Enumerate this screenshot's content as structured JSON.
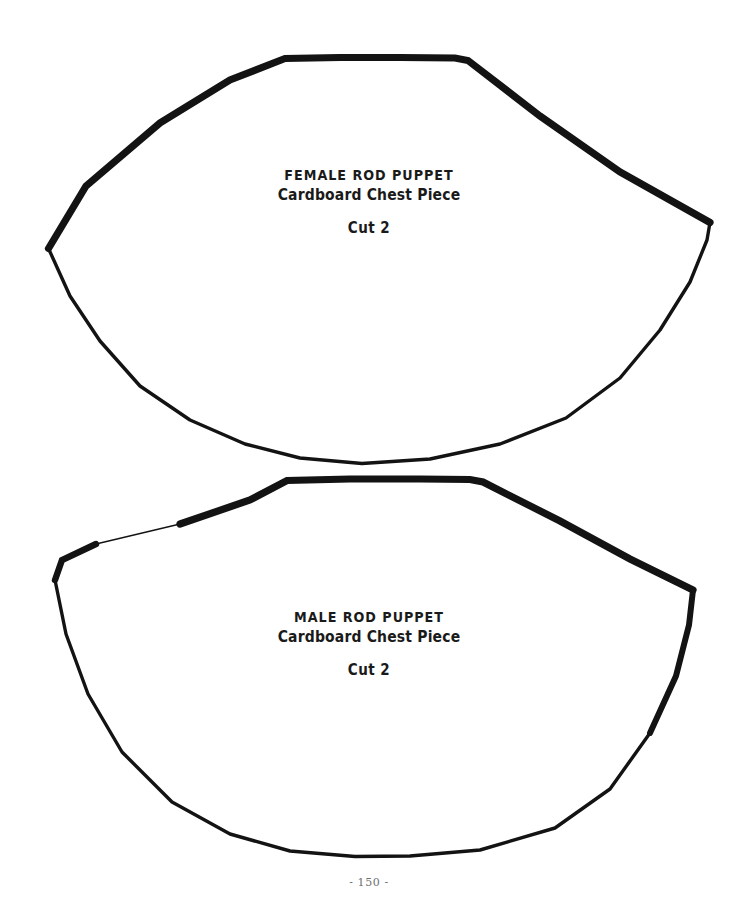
{
  "page": {
    "background_color": "#ffffff",
    "ink_color": "#131313",
    "page_number": "- 150 -",
    "page_number_color": "#6f6f6f"
  },
  "patterns": [
    {
      "id": "female-chest-piece",
      "title": "FEMALE ROD PUPPET",
      "subtitle": "Cardboard Chest Piece",
      "cut_instruction": "Cut 2",
      "shape_name": "fan-shaped-chest-piece",
      "outline_path": "M 48.5 248.5 L 86 186 L 160 123 L 230 80 L 285 58.5 L 340 57.5 L 400 57.5 L 455 58 L 468 60.5 L 540 116 L 620 172 L 710 222.5 L 707 240 L 690 282 L 660 330 L 620 378 L 566 418 L 500 444 L 430 459 L 362 463.5 L 300 458 L 245 444 L 190 420 L 140 386 L 100 341 L 70 296 Z",
      "heavy_segments": [
        "M 48.5 248.5 L 86 186 L 160 123 L 230 80 L 285 58.5 L 340 57.5 L 400 57.5 L 455 58 L 468 60.5 L 540 116 L 620 172 L 710 222.5"
      ],
      "thin_segments": [
        "M 710 222.5 L 707 240 L 690 282 L 660 330 L 620 378 L 566 418 L 500 444 L 430 459 L 362 463.5 L 300 458 L 245 444 L 190 420 L 140 386 L 100 341 L 70 296 L 48.5 248.5"
      ]
    },
    {
      "id": "male-chest-piece",
      "title": "MALE ROD PUPPET",
      "subtitle": "Cardboard Chest Piece",
      "cut_instruction": "Cut 2",
      "shape_name": "fan-shaped-chest-piece",
      "outline_path": "M 55 580 L 62 560 L 96 544 L 180 524 L 250 500 L 287 480.5 L 350 479 L 420 479 L 470 479.5 L 483 482 L 560 521 L 630 559 L 693 590 L 689 625 L 676 676 L 650 733 L 610 789 L 555 828 L 480 850 L 410 856 L 355 856.5 L 290 851 L 230 834 L 172 802 L 122 752 L 88 694 L 66 634 Z",
      "heavy_segments": [
        "M 55 580 L 62 560 L 96 544",
        "M 180 524 L 250 500 L 287 480.5 L 350 479 L 420 479 L 470 479.5 L 483 482 L 560 521 L 630 559 L 693 590",
        "M 693 590 L 689 625 L 676 676 L 650 733"
      ],
      "thin_segments": [
        "M 96 544 L 180 524",
        "M 650 733 L 610 789 L 555 828 L 480 850 L 410 856 L 355 856.5 L 290 851 L 230 834 L 172 802 L 122 752 L 88 694 L 66 634 L 55 580"
      ]
    }
  ]
}
